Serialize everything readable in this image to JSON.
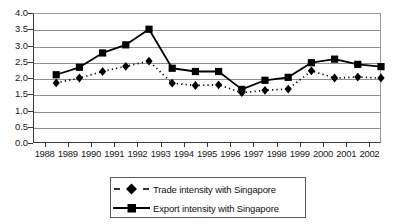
{
  "chart_data": {
    "type": "line",
    "title": "",
    "subtitle": "",
    "xlabel": "",
    "ylabel": "",
    "categories": [
      "1988",
      "1989",
      "1990",
      "1991",
      "1992",
      "1993",
      "1994",
      "1995",
      "1996",
      "1997",
      "1998",
      "1999",
      "2000",
      "2001",
      "2002"
    ],
    "xlim": [
      1987.5,
      2002.5
    ],
    "ylim": [
      0.0,
      4.0
    ],
    "ytick_labels": [
      "0.0",
      "0.5",
      "1.0",
      "1.5",
      "2.0",
      "2.5",
      "3.0",
      "3.5",
      "4.0"
    ],
    "ytick_values": [
      0.0,
      0.5,
      1.0,
      1.5,
      2.0,
      2.5,
      3.0,
      3.5,
      4.0
    ],
    "grid": true,
    "grid_axis": "y",
    "legend_position": "bottom-center",
    "series": [
      {
        "name": "Trade intensity with Singapore",
        "marker": "diamond",
        "line_style": "dotted",
        "color": "#000000",
        "values": [
          1.85,
          2.0,
          2.2,
          2.36,
          2.52,
          1.84,
          1.77,
          1.79,
          1.55,
          1.62,
          1.66,
          2.22,
          2.0,
          2.03,
          2.0
        ]
      },
      {
        "name": "Export intensity with Singapore",
        "marker": "square",
        "line_style": "solid",
        "color": "#000000",
        "values": [
          2.1,
          2.33,
          2.77,
          3.02,
          3.5,
          2.3,
          2.2,
          2.2,
          1.65,
          1.93,
          2.02,
          2.47,
          2.58,
          2.42,
          2.35
        ]
      }
    ]
  },
  "legend": {
    "items": [
      {
        "label": "Trade intensity with Singapore"
      },
      {
        "label": "Export intensity with Singapore"
      }
    ]
  }
}
